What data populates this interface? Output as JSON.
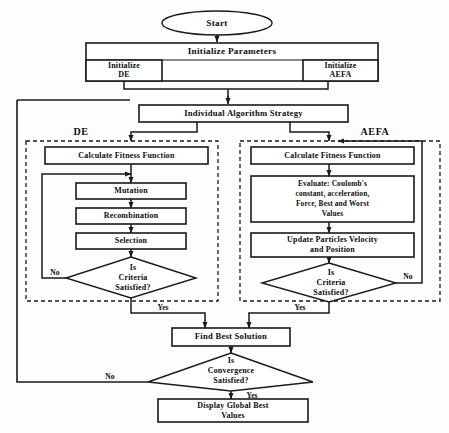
{
  "diagram": {
    "colors": {
      "stroke": "#1a1a1a",
      "fill": "#ffffff",
      "background": "#fdfdfd"
    }
  },
  "nodes": {
    "start": "Start",
    "initialize_parameters": "Initialize Parameters",
    "initialize_de_line1": "Initialize",
    "initialize_de_line2": "DE",
    "initialize_aefa_line1": "Initialize",
    "initialize_aefa_line2": "AEFA",
    "individual_algorithm_strategy": "Individual Algorithm Strategy",
    "de_calculate_fitness": "Calculate Fitness Function",
    "mutation": "Mutation",
    "recombination": "Recombination",
    "selection": "Selection",
    "de_criteria_line1": "Is",
    "de_criteria_line2": "Criteria",
    "de_criteria_line3": "Satisfied?",
    "aefa_calculate_fitness": "Calculate Fitness Function",
    "evaluate_line1": "Evaluate: Coulomb's",
    "evaluate_line2": "constant, acceleration,",
    "evaluate_line3": "Force, Best and Worst",
    "evaluate_line4": "Values",
    "update_particles_line1": "Update Particles Velocity",
    "update_particles_line2": "and Position",
    "aefa_criteria_line1": "Is",
    "aefa_criteria_line2": "Criteria",
    "aefa_criteria_line3": "Satisfied?",
    "find_best_solution": "Find Best Solution",
    "convergence_line1": "Is",
    "convergence_line2": "Convergence",
    "convergence_line3": "Satisfied?",
    "display_global_line1": "Display Global Best",
    "display_global_line2": "Values"
  },
  "groups": {
    "de_title": "DE",
    "aefa_title": "AEFA"
  },
  "edge_labels": {
    "de_no": "No",
    "de_yes": "Yes",
    "aefa_no": "No",
    "aefa_yes": "Yes",
    "convergence_no": "No",
    "convergence_yes": "Yes"
  }
}
